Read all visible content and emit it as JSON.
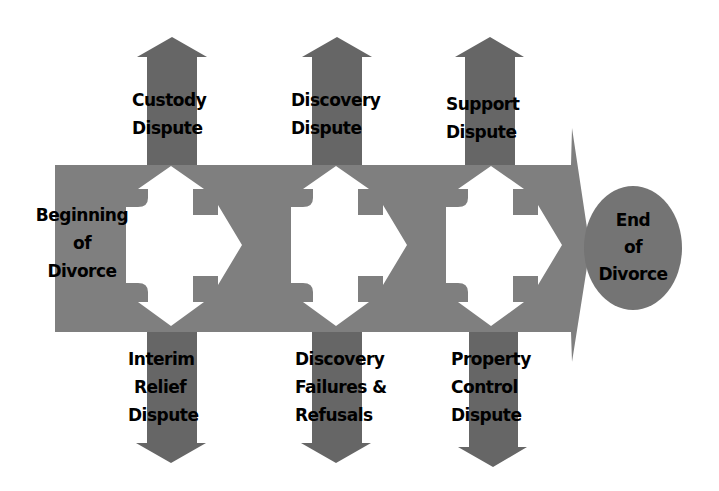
{
  "colors": {
    "band": "#7f7f7f",
    "arrow_dark": "#666666",
    "cross": "#ffffff",
    "end_circle": "#747474",
    "text": "#000000",
    "background": "#ffffff"
  },
  "start_label": "Beginning of Divorce",
  "start": {
    "line1": "Beginning",
    "line2": "of",
    "line3": "Divorce"
  },
  "end": {
    "line1": "End",
    "line2": "of",
    "line3": "Divorce"
  },
  "stages": [
    {
      "up": {
        "line1": "Custody",
        "line2": "Dispute"
      },
      "down": {
        "line1": "Interim",
        "line2": "Relief",
        "line3": "Dispute"
      }
    },
    {
      "up": {
        "line1": "Discovery",
        "line2": "Dispute"
      },
      "down": {
        "line1": "Discovery",
        "line2": "Failures &",
        "line3": "Refusals"
      }
    },
    {
      "up": {
        "line1": "Support",
        "line2": "Dispute"
      },
      "down": {
        "line1": "Property",
        "line2": "Control",
        "line3": "Dispute"
      }
    }
  ]
}
